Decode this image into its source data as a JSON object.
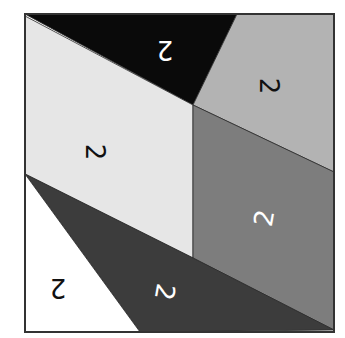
{
  "diagram": {
    "frame": {
      "x": 25,
      "y": 14,
      "width": 309,
      "height": 318,
      "stroke": "#333333"
    },
    "regions": [
      {
        "name": "black-triangle-region",
        "fill": "#0a0a0a",
        "points": "25,14 237,14 193,105",
        "label": "2",
        "label_color": "#ffffff",
        "label_x": 165,
        "label_y": 50,
        "label_rotate": 180
      },
      {
        "name": "light-gray-region",
        "fill": "#b3b3b3",
        "points": "237,14 334,14 334,172 193,105",
        "label": "2",
        "label_color": "#111111",
        "label_x": 269,
        "label_y": 86,
        "label_rotate": 90
      },
      {
        "name": "off-white-region",
        "fill": "#e6e6e6",
        "points": "25,16 193,105 193,258 25,174",
        "label": "2",
        "label_color": "#111111",
        "label_x": 95,
        "label_y": 152,
        "label_rotate": 90
      },
      {
        "name": "medium-gray-region",
        "fill": "#7d7d7d",
        "points": "193,105 334,172 334,330 193,258",
        "label": "2",
        "label_color": "#ffffff",
        "label_x": 264,
        "label_y": 218,
        "label_rotate": -80
      },
      {
        "name": "dark-gray-region",
        "fill": "#3c3c3c",
        "points": "25,174 193,258 334,330 140,332",
        "label": "2",
        "label_color": "#ffffff",
        "label_x": 165,
        "label_y": 292,
        "label_rotate": 100
      },
      {
        "name": "white-region",
        "fill": "#ffffff",
        "points": "25,174 140,332 25,332",
        "label": "2",
        "label_color": "#111111",
        "label_x": 58,
        "label_y": 288,
        "label_rotate": 180
      }
    ]
  }
}
